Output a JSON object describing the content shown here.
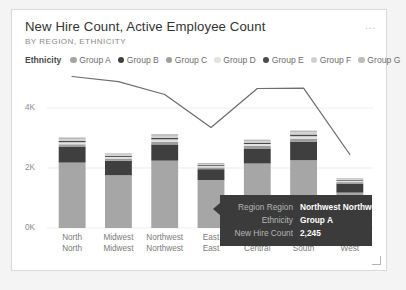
{
  "card": {
    "title": "New Hire Count, Active Employee Count",
    "subtitle": "BY REGION, ETHNICITY",
    "more_menu": "…",
    "more_menu_name": "more-options-icon"
  },
  "legend": {
    "title": "Ethnicity",
    "items": [
      {
        "label": "Group A",
        "color": "#a6a6a6"
      },
      {
        "label": "Group B",
        "color": "#3f3f3f"
      },
      {
        "label": "Group C",
        "color": "#9e9e9e"
      },
      {
        "label": "Group D",
        "color": "#e3e3e3"
      },
      {
        "label": "Group E",
        "color": "#4a4a4a"
      },
      {
        "label": "Group F",
        "color": "#d0d0d0"
      },
      {
        "label": "Group G",
        "color": "#bcbcbc"
      }
    ]
  },
  "tooltip": {
    "rows": [
      {
        "key": "Region Region",
        "value": "Northwest Northwest"
      },
      {
        "key": "Ethnicity",
        "value": "Group A"
      },
      {
        "key": "New Hire Count",
        "value": "2,245"
      }
    ],
    "background": "#3b3b3b"
  },
  "chart_data": {
    "type": "bar",
    "subtype": "stacked-column-plus-line",
    "title": "New Hire Count, Active Employee Count",
    "subtitle": "BY REGION, ETHNICITY",
    "xlabel": "",
    "ylabel": "",
    "ylim": [
      0,
      5000
    ],
    "yticks": [
      0,
      2000,
      4000
    ],
    "ytick_labels": [
      "0K",
      "2K",
      "4K"
    ],
    "grid": false,
    "legend_position": "top",
    "categories": [
      "North North",
      "Midwest Midwest",
      "Northwest Northwest",
      "East East",
      "Central Central",
      "South South",
      "West West"
    ],
    "series": [
      {
        "name": "Group A",
        "type": "bar",
        "color": "#a6a6a6",
        "values": [
          2180,
          1760,
          2245,
          1600,
          2150,
          2260,
          1180
        ]
      },
      {
        "name": "Group B",
        "type": "bar",
        "color": "#3f3f3f",
        "values": [
          520,
          480,
          540,
          360,
          500,
          620,
          300
        ]
      },
      {
        "name": "Group C",
        "type": "bar",
        "color": "#9e9e9e",
        "values": [
          90,
          75,
          95,
          60,
          85,
          100,
          50
        ]
      },
      {
        "name": "Group D",
        "type": "bar",
        "color": "#e3e3e3",
        "values": [
          70,
          55,
          75,
          45,
          65,
          80,
          40
        ]
      },
      {
        "name": "Group E",
        "type": "bar",
        "color": "#4a4a4a",
        "values": [
          45,
          35,
          50,
          30,
          42,
          55,
          25
        ]
      },
      {
        "name": "Group F",
        "type": "bar",
        "color": "#d0d0d0",
        "values": [
          60,
          45,
          65,
          38,
          55,
          70,
          32
        ]
      },
      {
        "name": "Group G",
        "type": "bar",
        "color": "#bcbcbc",
        "values": [
          55,
          40,
          60,
          35,
          50,
          65,
          30
        ]
      },
      {
        "name": "Active Employee Count",
        "type": "line",
        "color": "#6e6e6e",
        "values": [
          5050,
          4880,
          4450,
          3350,
          4650,
          4660,
          2450
        ]
      }
    ]
  },
  "resize_handle_name": "resize-handle"
}
